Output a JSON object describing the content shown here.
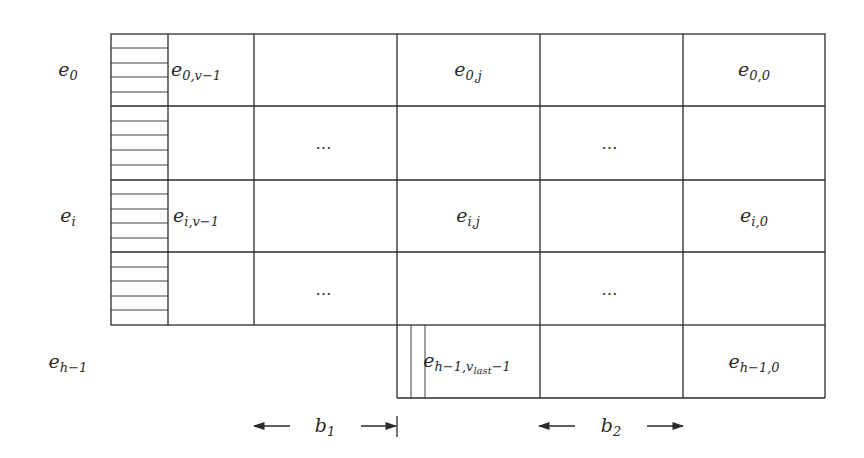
{
  "diagram": {
    "type": "block-grid",
    "row_labels": [
      {
        "base": "e",
        "sub": "0",
        "row": 0
      },
      {
        "base": "e",
        "sub": "i",
        "row": 2
      },
      {
        "base": "e",
        "sub": "h−1",
        "row": 4
      }
    ],
    "cells": [
      {
        "base": "e",
        "sub": "0,v−1",
        "row": 0,
        "col": 0
      },
      {
        "base": "e",
        "sub": "0,j",
        "row": 0,
        "col": 2
      },
      {
        "base": "e",
        "sub": "0,0",
        "row": 0,
        "col": 4
      },
      {
        "base": "e",
        "sub": "i,v−1",
        "row": 2,
        "col": 0
      },
      {
        "base": "e",
        "sub": "i,j",
        "row": 2,
        "col": 2
      },
      {
        "base": "e",
        "sub": "i,0",
        "row": 2,
        "col": 4
      },
      {
        "base": "e",
        "sub": "h−1,v",
        "subsub": "last",
        "tail": "−1",
        "row": 4,
        "col": 2
      },
      {
        "base": "e",
        "sub": "h−1,0",
        "row": 4,
        "col": 4
      }
    ],
    "ellipses": [
      {
        "text": "…",
        "row": 1,
        "col": 1
      },
      {
        "text": "…",
        "row": 1,
        "col": 3
      },
      {
        "text": "…",
        "row": 3,
        "col": 1
      },
      {
        "text": "…",
        "row": 3,
        "col": 3
      }
    ],
    "dimensions": [
      {
        "label_base": "b",
        "label_sub": "1",
        "span": "block 1"
      },
      {
        "label_base": "b",
        "label_sub": "2",
        "span": "block 2"
      }
    ],
    "colors": {
      "line": "#2b2b2b",
      "background": "#ffffff",
      "text": "#2a2a2a"
    }
  }
}
